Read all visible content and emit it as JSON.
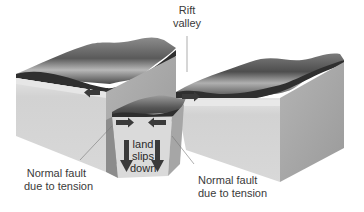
{
  "diagram": {
    "labels": {
      "rift_valley_line1": "Rift",
      "rift_valley_line2": "valley",
      "left_fault_line1": "Normal fault",
      "left_fault_line2": "due to tension",
      "right_fault_line1": "Normal fault",
      "right_fault_line2": "due to tension",
      "center_line1": "land",
      "center_line2": "slips",
      "center_line3": "down"
    },
    "arrows": [
      {
        "block": "left",
        "direction": "left"
      },
      {
        "block": "center",
        "direction": "right"
      },
      {
        "block": "center",
        "direction": "left"
      },
      {
        "block": "right",
        "direction": "right"
      },
      {
        "block": "center",
        "direction": "down"
      },
      {
        "block": "center",
        "direction": "down"
      }
    ],
    "colors": {
      "background": "#ffffff",
      "top_surface_dark": "#2e2e2e",
      "top_surface_light": "#9a9a9a",
      "front_face": "#d6d6d6",
      "side_face": "#a9a9a9",
      "arrow": "#3a3a3a",
      "text": "#3a3a3a"
    }
  }
}
